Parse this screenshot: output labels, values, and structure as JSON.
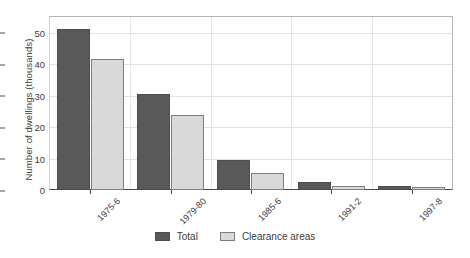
{
  "chart_data": {
    "type": "bar",
    "title": "",
    "xlabel": "",
    "ylabel": "Number of dwellings (thousands)",
    "categories": [
      "1975-6",
      "1979-80",
      "1985-6",
      "1991-2",
      "1997-8"
    ],
    "series": [
      {
        "name": "Total",
        "color": "#595959",
        "values": [
          51.3,
          30.5,
          9.5,
          2.5,
          1.2
        ]
      },
      {
        "name": "Clearance areas",
        "color": "#d9d9d9",
        "values": [
          41.7,
          23.9,
          5.4,
          1.3,
          1.0
        ]
      }
    ],
    "ylim": [
      0,
      55
    ],
    "yticks": [
      0,
      10,
      20,
      30,
      40,
      50
    ],
    "ytick_labels": [
      "0",
      "10",
      "20",
      "30",
      "40",
      "50"
    ],
    "grid": "horizontal-and-vertical",
    "legend_position": "bottom-center"
  }
}
